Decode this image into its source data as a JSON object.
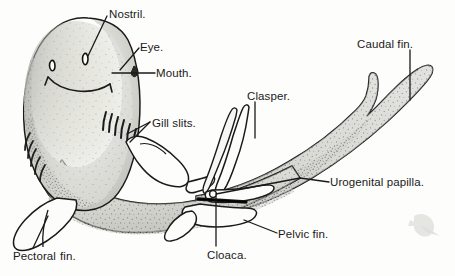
{
  "figure": {
    "view": "ventral view of a nurse shark",
    "background_color": "#fdfdfc",
    "ink_color": "#1a1a1a",
    "body_fill_color": "#d8d8d4",
    "fin_fill_color": "#fefefe"
  },
  "labels": {
    "nostril": "Nostril.",
    "eye": "Eye.",
    "mouth": "Mouth.",
    "gill_slits": "Gill slits.",
    "clasper": "Clasper.",
    "caudal_fin": "Caudal fin.",
    "urogenital_papilla": "Urogenital papilla.",
    "pelvic_fin": "Pelvic fin.",
    "cloaca": "Cloaca.",
    "pectoral_fin_first": "Pectoral",
    "pectoral_fin_second": "fin."
  },
  "parts": [
    {
      "name": "nostril",
      "label": "Nostril."
    },
    {
      "name": "eye",
      "label": "Eye."
    },
    {
      "name": "mouth",
      "label": "Mouth."
    },
    {
      "name": "gill-slits",
      "label": "Gill slits."
    },
    {
      "name": "clasper",
      "label": "Clasper."
    },
    {
      "name": "caudal-fin",
      "label": "Caudal fin."
    },
    {
      "name": "urogenital-papilla",
      "label": "Urogenital papilla."
    },
    {
      "name": "pelvic-fin",
      "label": "Pelvic fin."
    },
    {
      "name": "cloaca",
      "label": "Cloaca."
    },
    {
      "name": "pectoral-fin",
      "label": "Pectoral fin."
    }
  ]
}
